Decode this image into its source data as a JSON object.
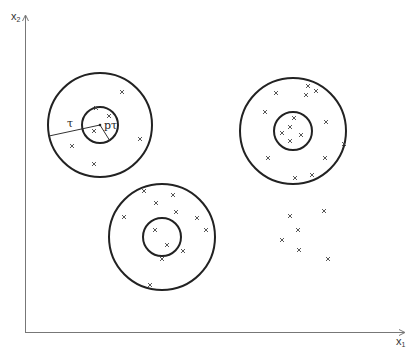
{
  "diagram": {
    "axes": {
      "x_label": "x",
      "x_sub": "1",
      "y_label": "x",
      "y_sub": "2",
      "color": "#777777"
    },
    "annotations": {
      "outer_radius_label": "τ",
      "inner_radius_label": "pτ"
    },
    "circle_color": "#222222",
    "marker_color": "#444444",
    "clusters": [
      {
        "name": "upper-left",
        "center": [
          100,
          125
        ],
        "outer_r": 52,
        "inner_r": 18,
        "points": [
          [
            122,
            92
          ],
          [
            96,
            108
          ],
          [
            109,
            116
          ],
          [
            94,
            131
          ],
          [
            72,
            146
          ],
          [
            140,
            139
          ],
          [
            94,
            164
          ]
        ]
      },
      {
        "name": "upper-right",
        "center": [
          293,
          131
        ],
        "outer_r": 53,
        "inner_r": 19,
        "points": [
          [
            308,
            86
          ],
          [
            316,
            91
          ],
          [
            276,
            93
          ],
          [
            306,
            95
          ],
          [
            265,
            112
          ],
          [
            294,
            118
          ],
          [
            326,
            122
          ],
          [
            290,
            127
          ],
          [
            282,
            133
          ],
          [
            301,
            135
          ],
          [
            290,
            141
          ],
          [
            344,
            144
          ],
          [
            268,
            158
          ],
          [
            325,
            158
          ],
          [
            295,
            178
          ],
          [
            312,
            175
          ]
        ]
      },
      {
        "name": "bottom-middle",
        "center": [
          162,
          237
        ],
        "outer_r": 53,
        "inner_r": 19,
        "points": [
          [
            144,
            191
          ],
          [
            173,
            195
          ],
          [
            156,
            203
          ],
          [
            176,
            212
          ],
          [
            124,
            217
          ],
          [
            197,
            218
          ],
          [
            206,
            230
          ],
          [
            155,
            230
          ],
          [
            167,
            245
          ],
          [
            183,
            251
          ],
          [
            162,
            259
          ],
          [
            150,
            285
          ]
        ]
      },
      {
        "name": "loose-right",
        "center": null,
        "outer_r": null,
        "inner_r": null,
        "points": [
          [
            290,
            216
          ],
          [
            324,
            211
          ],
          [
            298,
            230
          ],
          [
            282,
            240
          ],
          [
            299,
            250
          ],
          [
            328,
            259
          ]
        ]
      }
    ]
  }
}
